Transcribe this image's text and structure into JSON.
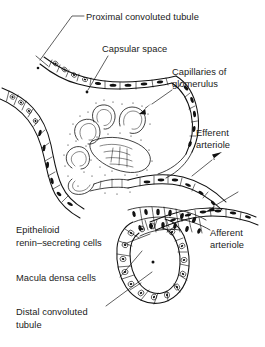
{
  "figure": {
    "style": "black-and-white line drawing",
    "ink_color": "#111111",
    "background_color": "#ffffff"
  },
  "labels": {
    "proximal_convoluted_tubule": "Proximal convoluted tubule",
    "capsular_space": "Capsular space",
    "capillaries_of_glomerulus_line1": "Capillaries of",
    "capillaries_of_glomerulus_line2": "glomerulus",
    "efferent_arteriole_line1": "Efferent",
    "efferent_arteriole_line2": "arteriole",
    "afferent_arteriole_line1": "Afferent",
    "afferent_arteriole_line2": "arteriole",
    "epithelioid_line1": "Epithelioid",
    "epithelioid_line2": "renin–secreting cells",
    "macula_densa_cells": "Macula densa cells",
    "distal_convoluted_tubule_line1": "Distal convoluted",
    "distal_convoluted_tubule_line2": "tubule"
  },
  "structures": {
    "bowmans_capsule": "parietal epithelium of Bowman's capsule",
    "glomerular_tuft": "convoluted glomerular capillary loops",
    "proximal_tubule": "proximal convoluted tubule wall with cuboidal cells",
    "distal_tubule": "distal convoluted tubule ring with macula densa cells",
    "efferent_vessel": "efferent arteriole with outward flow arrow",
    "afferent_vessel": "afferent arteriole with inward flow arrow",
    "juxtaglomerular_cells": "epithelioid renin-secreting cell cluster"
  },
  "markers": {
    "capsular_space_dot": "leader terminus dot in capsular space",
    "distal_lumen_dot": "leader terminus dot in distal tubule lumen",
    "glomerulus_arrow": "arrow pointing down-left into glomerular tuft",
    "efferent_arrow": "arrow pointing up-right, blood leaving",
    "afferent_arrow": "arrow pointing down-left, blood entering"
  }
}
